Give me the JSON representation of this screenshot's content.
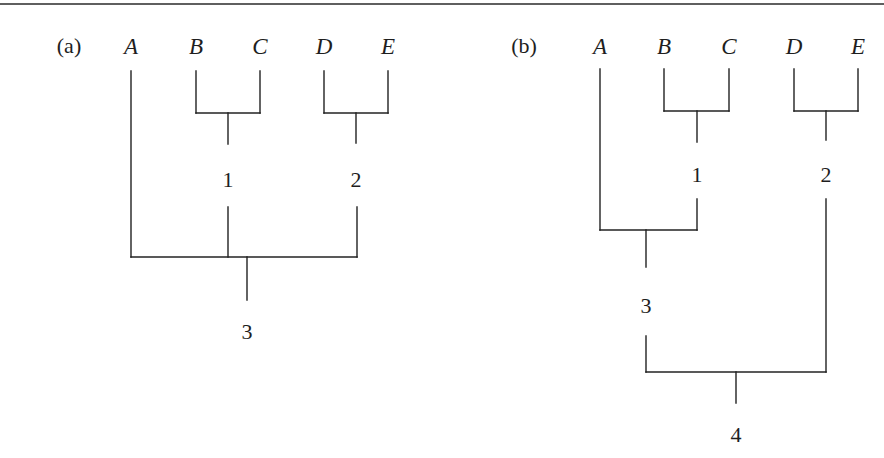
{
  "figure": {
    "top_rule": {
      "y": 4,
      "color": "#2a2a2a"
    },
    "line_color": "#222222",
    "panels": [
      {
        "tag": "(a)",
        "tag_pos": [
          69,
          46
        ],
        "leaves": [
          {
            "label": "A",
            "x": 131,
            "y": 46
          },
          {
            "label": "B",
            "x": 196,
            "y": 46
          },
          {
            "label": "C",
            "x": 260,
            "y": 46
          },
          {
            "label": "D",
            "x": 324,
            "y": 46
          },
          {
            "label": "E",
            "x": 388,
            "y": 46
          }
        ],
        "nodes": [
          {
            "label": "1",
            "x": 228,
            "y": 180
          },
          {
            "label": "2",
            "x": 356,
            "y": 180
          },
          {
            "label": "3",
            "x": 247,
            "y": 332
          }
        ],
        "segments": [
          [
            131,
            71,
            131,
            257
          ],
          [
            196,
            71,
            196,
            113
          ],
          [
            260,
            71,
            260,
            113
          ],
          [
            196,
            113,
            260,
            113
          ],
          [
            228,
            113,
            228,
            144
          ],
          [
            324,
            71,
            324,
            113
          ],
          [
            388,
            71,
            388,
            113
          ],
          [
            324,
            113,
            388,
            113
          ],
          [
            356,
            113,
            356,
            143
          ],
          [
            228,
            207,
            228,
            257
          ],
          [
            357,
            207,
            357,
            257
          ],
          [
            131,
            257,
            357,
            257
          ],
          [
            247,
            257,
            247,
            300
          ]
        ]
      },
      {
        "tag": "(b)",
        "tag_pos": [
          524,
          46
        ],
        "leaves": [
          {
            "label": "A",
            "x": 600,
            "y": 46
          },
          {
            "label": "B",
            "x": 664,
            "y": 46
          },
          {
            "label": "C",
            "x": 729,
            "y": 46
          },
          {
            "label": "D",
            "x": 794,
            "y": 46
          },
          {
            "label": "E",
            "x": 858,
            "y": 46
          }
        ],
        "nodes": [
          {
            "label": "1",
            "x": 697,
            "y": 175
          },
          {
            "label": "2",
            "x": 826,
            "y": 175
          },
          {
            "label": "3",
            "x": 646,
            "y": 306
          },
          {
            "label": "4",
            "x": 736,
            "y": 435
          }
        ],
        "segments": [
          [
            600,
            69,
            600,
            230
          ],
          [
            664,
            69,
            664,
            111
          ],
          [
            729,
            69,
            729,
            111
          ],
          [
            664,
            111,
            729,
            111
          ],
          [
            697,
            111,
            697,
            142
          ],
          [
            794,
            69,
            794,
            111
          ],
          [
            858,
            69,
            858,
            111
          ],
          [
            794,
            111,
            858,
            111
          ],
          [
            826,
            111,
            826,
            140
          ],
          [
            697,
            199,
            697,
            230
          ],
          [
            600,
            230,
            697,
            230
          ],
          [
            646,
            230,
            646,
            267
          ],
          [
            826,
            199,
            826,
            372
          ],
          [
            646,
            336,
            646,
            372
          ],
          [
            646,
            372,
            826,
            372
          ],
          [
            736,
            372,
            736,
            403
          ]
        ]
      }
    ]
  }
}
